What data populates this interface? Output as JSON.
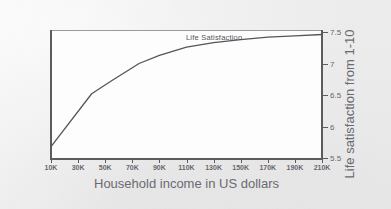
{
  "figure": {
    "background_color": "#ececec",
    "plot_background_color": "#fdfdfd",
    "axis_color": "#5b5b60",
    "line_color": "#55555a",
    "ghost_text_top": "",
    "ghost_text_left": ""
  },
  "chart_data": {
    "type": "line",
    "title": "",
    "subtitle": "",
    "xlabel": "Household income in US dollars",
    "ylabel": "Life satisfaction from 1-10",
    "series_label": "Life Satisfaction",
    "legend_position": "inline-above-curve",
    "grid": false,
    "xlim": [
      10000,
      210000
    ],
    "ylim": [
      5.5,
      7.5
    ],
    "x_tick_labels": [
      "10K",
      "30K",
      "50K",
      "70K",
      "90K",
      "110K",
      "130K",
      "150K",
      "170K",
      "190K",
      "210K"
    ],
    "x_tick_values": [
      10000,
      30000,
      50000,
      70000,
      90000,
      110000,
      130000,
      150000,
      170000,
      190000,
      210000
    ],
    "y_tick_labels": [
      "7.5",
      "7",
      "6.5",
      "6",
      "5.5"
    ],
    "y_tick_values": [
      7.5,
      7,
      6.5,
      6,
      5.5
    ],
    "series": [
      {
        "name": "Life Satisfaction",
        "x": [
          10000,
          40000,
          55000,
          75000,
          90000,
          110000,
          130000,
          150000,
          170000,
          190000,
          210000
        ],
        "values": [
          5.68,
          6.52,
          6.73,
          7.0,
          7.13,
          7.26,
          7.33,
          7.38,
          7.42,
          7.44,
          7.46
        ]
      }
    ]
  }
}
